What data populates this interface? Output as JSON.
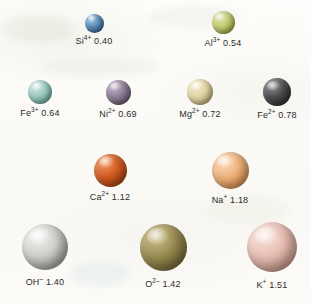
{
  "figure": {
    "units": "angstroms",
    "background_color": "#fbfaf7"
  },
  "chart_data": {
    "type": "scatter",
    "xlabel": "",
    "ylabel": "",
    "note": "Sphere diameter is proportional to the ionic radius value shown in each label (angstroms).",
    "categories": [
      "Si4+",
      "Al3+",
      "Fe3+",
      "Ni2+",
      "Mg2+",
      "Fe2+",
      "Ca2+",
      "Na+",
      "OH-",
      "O2-",
      "K+"
    ],
    "values": [
      0.4,
      0.54,
      0.64,
      0.69,
      0.72,
      0.78,
      1.12,
      1.18,
      1.4,
      1.42,
      1.51
    ]
  },
  "rows": [
    {
      "row_index": 1,
      "ions": [
        {
          "id": "si4",
          "element": "Si",
          "charge": "4+",
          "radius": "0.40",
          "label_element": "Si",
          "label_charge": "4+",
          "label_value": "0.40",
          "color": "#5b8cb8",
          "color_dark": "#2f5a82",
          "color_light": "#a8c8e0",
          "diameter": 19,
          "center_x": 94,
          "center_y": 23
        },
        {
          "id": "al3",
          "element": "Al",
          "charge": "3+",
          "radius": "0.54",
          "label_element": "Al",
          "label_charge": "3+",
          "label_value": "0.54",
          "color": "#c3cb72",
          "color_dark": "#8f9a41",
          "color_light": "#e2e7b4",
          "diameter": 23,
          "center_x": 223,
          "center_y": 22
        }
      ]
    },
    {
      "row_index": 2,
      "ions": [
        {
          "id": "fe3",
          "element": "Fe",
          "charge": "3+",
          "radius": "0.64",
          "label_element": "Fe",
          "label_charge": "3+",
          "label_value": "0.64",
          "color": "#9cc9c0",
          "color_dark": "#5f9a90",
          "color_light": "#d5eae5",
          "diameter": 24,
          "center_x": 40,
          "center_y": 92
        },
        {
          "id": "ni2",
          "element": "Ni",
          "charge": "2+",
          "radius": "0.69",
          "label_element": "Ni",
          "label_charge": "2+",
          "label_value": "0.69",
          "color": "#8d7e95",
          "color_dark": "#5d4f66",
          "color_light": "#c4b8ca",
          "diameter": 25,
          "center_x": 118,
          "center_y": 92
        },
        {
          "id": "mg2",
          "element": "Mg",
          "charge": "2+",
          "radius": "0.72",
          "label_element": "Mg",
          "label_charge": "2+",
          "label_value": "0.72",
          "color": "#e0d3a4",
          "color_dark": "#b5a46b",
          "color_light": "#f4ecd2",
          "diameter": 26,
          "center_x": 200,
          "center_y": 92
        },
        {
          "id": "fe2",
          "element": "Fe",
          "charge": "2+",
          "radius": "0.78",
          "label_element": "Fe",
          "label_charge": "2+",
          "label_value": "0.78",
          "color": "#4e4e50",
          "color_dark": "#232325",
          "color_light": "#8e8e92",
          "diameter": 28,
          "center_x": 277,
          "center_y": 92
        }
      ]
    },
    {
      "row_index": 3,
      "ions": [
        {
          "id": "ca2",
          "element": "Ca",
          "charge": "2+",
          "radius": "1.12",
          "label_element": "Ca",
          "label_charge": "2+",
          "label_value": "1.12",
          "color": "#d25a20",
          "color_dark": "#9b3c0c",
          "color_light": "#ef9b63",
          "diameter": 33,
          "center_x": 110,
          "center_y": 170
        },
        {
          "id": "na1",
          "element": "Na",
          "charge": "+",
          "radius": "1.18",
          "label_element": "Na",
          "label_charge": "+",
          "label_value": "1.18",
          "color": "#efb37c",
          "color_dark": "#c8834a",
          "color_light": "#fbdcbd",
          "diameter": 37,
          "center_x": 230,
          "center_y": 170
        }
      ]
    },
    {
      "row_index": 4,
      "ions": [
        {
          "id": "oh1",
          "element": "OH",
          "charge": "–",
          "radius": "1.40",
          "label_element": "OH",
          "label_charge": "–",
          "label_value": "1.40",
          "color": "#cfd0cb",
          "color_dark": "#96978f",
          "color_light": "#f2f3f0",
          "diameter": 46,
          "center_x": 45,
          "center_y": 247
        },
        {
          "id": "o2",
          "element": "O",
          "charge": "2–",
          "radius": "1.42",
          "label_element": "O",
          "label_charge": "2–",
          "label_value": "1.42",
          "color": "#9b8d52",
          "color_dark": "#6b6030",
          "color_light": "#cfc18a",
          "diameter": 47,
          "center_x": 163,
          "center_y": 247
        },
        {
          "id": "k1",
          "element": "K",
          "charge": "+",
          "radius": "1.51",
          "label_element": "K",
          "label_charge": "+",
          "label_value": "1.51",
          "color": "#e8bfb4",
          "color_dark": "#c0907f",
          "color_light": "#f9e6df",
          "diameter": 50,
          "center_x": 272,
          "center_y": 247
        }
      ]
    }
  ]
}
